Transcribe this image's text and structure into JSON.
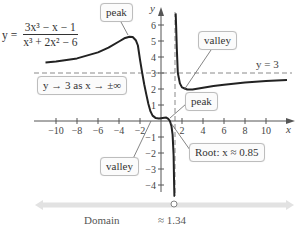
{
  "chart_data": {
    "type": "line",
    "title": "",
    "function": {
      "lhs": "y =",
      "numerator": "3x³ − x − 1",
      "denominator": "x³ + 2x² − 6"
    },
    "xlabel": "x",
    "ylabel": "y",
    "xlim": [
      -11.5,
      12.5
    ],
    "ylim": [
      -4.5,
      6.8
    ],
    "x_ticks": [
      -10,
      -8,
      -6,
      -4,
      -2,
      2,
      4,
      6,
      8,
      10
    ],
    "x_tick_labels": [
      "−10",
      "−8",
      "−6",
      "−4",
      "−2",
      "2",
      "4",
      "6",
      "8",
      "10"
    ],
    "y_ticks": [
      -4,
      -3,
      -2,
      -1,
      1,
      2,
      3,
      4,
      5,
      6
    ],
    "y_tick_labels": [
      "−4",
      "−3",
      "−2",
      "−1",
      "1",
      "2",
      "3",
      "4",
      "5",
      "6"
    ],
    "grid": false,
    "series": [
      {
        "name": "left branch",
        "x": [
          -11,
          -10,
          -8,
          -6,
          -5,
          -4,
          -3.5,
          -3,
          -2.7,
          -2.4,
          -2.2,
          -2,
          -1.8,
          -1.6,
          -1.4,
          -1.2,
          -1,
          -0.8,
          -0.5,
          -0.2,
          0,
          0.3,
          0.5,
          0.7,
          0.85,
          1,
          1.1,
          1.2,
          1.25,
          1.28,
          1.3,
          1.31
        ],
        "y": [
          3.66,
          3.71,
          3.91,
          4.29,
          4.58,
          4.97,
          5.17,
          5.27,
          5.25,
          5.05,
          4.72,
          3.83,
          3.04,
          2.3,
          1.66,
          1.06,
          0.6,
          0.34,
          0.18,
          0.15,
          0.167,
          0.2,
          0.21,
          0.14,
          0.0,
          -0.33,
          -0.85,
          -2.14,
          -3.9,
          -6.5,
          -10.1,
          -14
        ]
      },
      {
        "name": "right branch",
        "x": [
          1.37,
          1.4,
          1.45,
          1.5,
          1.6,
          1.8,
          2,
          2.5,
          3,
          4,
          5,
          6,
          8,
          10,
          12
        ],
        "y": [
          14,
          8.78,
          5.8,
          4.55,
          3.01,
          2.35,
          2.1,
          1.97,
          1.97,
          2.08,
          2.18,
          2.27,
          2.41,
          2.5,
          2.57
        ]
      }
    ],
    "asymptotes": [
      {
        "type": "horizontal",
        "value": 3,
        "label": "y = 3"
      },
      {
        "type": "vertical",
        "value": 1.34,
        "label": "≈ 1.34"
      }
    ],
    "annotations": [
      {
        "text": "peak",
        "target": [
          -3,
          5.27
        ]
      },
      {
        "text": "valley",
        "target": [
          3,
          1.97
        ]
      },
      {
        "text": "peak",
        "target": [
          0.5,
          0.21
        ]
      },
      {
        "text": "valley",
        "target": [
          -0.2,
          0.15
        ]
      },
      {
        "text": "Root: x ≈ 0.85",
        "target": [
          0.85,
          0
        ]
      },
      {
        "text": "y → 3 as x → ±∞"
      }
    ],
    "domain": {
      "label": "Domain",
      "excluded": "≈ 1.34"
    }
  },
  "labels": {
    "eq_lhs": "y =",
    "eq_num": "3x³ − x − 1",
    "eq_den": "x³ + 2x² − 6",
    "peak_top": "peak",
    "valley_top": "valley",
    "peak_low": "peak",
    "valley_low": "valley",
    "root": "Root: x ≈ 0.85",
    "limit": "y → 3 as x → ±∞",
    "h_asym": "y = 3",
    "x_axis": "x",
    "y_axis": "y",
    "domain": "Domain",
    "excluded": "≈ 1.34"
  },
  "colors": {
    "curve": "#222222",
    "axis": "#555555",
    "dashed": "#888888",
    "domain_bar": "#e0e0e0"
  }
}
